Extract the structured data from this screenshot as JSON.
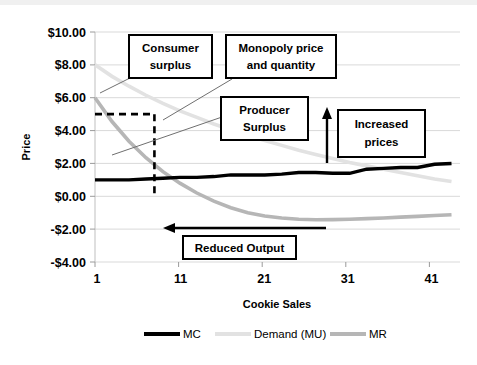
{
  "chart_data": {
    "type": "line",
    "title": "",
    "subtitle": "",
    "xlabel": "Cookie Sales",
    "ylabel": "Price",
    "xlim": [
      1,
      44
    ],
    "ylim": [
      -4,
      10
    ],
    "xticks": [
      "1",
      "11",
      "21",
      "31",
      "41"
    ],
    "xtick_values": [
      1,
      11,
      21,
      31,
      41
    ],
    "yticks": [
      "-$4.00",
      "-$2.00",
      "$0.00",
      "$2.00",
      "$4.00",
      "$6.00",
      "$8.00",
      "$10.00"
    ],
    "ytick_values": [
      -4,
      -2,
      0,
      2,
      4,
      6,
      8,
      10
    ],
    "grid": "horizontal",
    "legend_position": "bottom",
    "x": [
      1,
      3,
      5,
      7,
      9,
      11,
      13,
      15,
      17,
      19,
      21,
      23,
      25,
      27,
      29,
      31,
      33,
      35,
      37,
      39,
      41,
      43
    ],
    "series": [
      {
        "name": "MC",
        "color": "#000000",
        "values": [
          1.0,
          1.0,
          1.0,
          1.05,
          1.1,
          1.15,
          1.15,
          1.2,
          1.3,
          1.3,
          1.3,
          1.35,
          1.45,
          1.45,
          1.4,
          1.4,
          1.65,
          1.7,
          1.75,
          1.75,
          1.95,
          2.0
        ]
      },
      {
        "name": "Demand (MU)",
        "color": "#e2e2e2",
        "values": [
          8.0,
          7.3,
          6.7,
          6.15,
          5.65,
          5.2,
          4.8,
          4.4,
          4.05,
          3.7,
          3.4,
          3.1,
          2.8,
          2.55,
          2.3,
          2.05,
          1.85,
          1.65,
          1.45,
          1.25,
          1.05,
          0.9
        ]
      },
      {
        "name": "MR",
        "color": "#b6b6b6",
        "values": [
          6.0,
          4.55,
          3.35,
          2.35,
          1.5,
          0.8,
          0.2,
          -0.3,
          -0.7,
          -1.0,
          -1.2,
          -1.32,
          -1.4,
          -1.43,
          -1.42,
          -1.4,
          -1.36,
          -1.32,
          -1.27,
          -1.22,
          -1.17,
          -1.12
        ]
      }
    ],
    "reference_lines": [
      {
        "name": "monopoly-price-quantity-dashed",
        "style": "dashed",
        "color": "#000000",
        "price": 5.0,
        "quantity": 8.0,
        "from_y_axis": true,
        "down_to": 0.0
      }
    ],
    "annotations": [
      {
        "name": "consumer-surplus",
        "label_line1": "Consumer",
        "label_line2": "surplus",
        "points_to": "area above demand curve"
      },
      {
        "name": "monopoly-price-and-quantity",
        "label_line1": "Monopoly price",
        "label_line2": "and quantity",
        "points_to": "dashed intersection at $5.00 / Q=8"
      },
      {
        "name": "producer-surplus",
        "label_line1": "Producer",
        "label_line2": "Surplus",
        "points_to": "area between MC and price"
      },
      {
        "name": "increased-prices",
        "label_line1": "Increased",
        "label_line2": "prices",
        "arrow": "up"
      },
      {
        "name": "reduced-output",
        "label_line1": "Reduced  Output",
        "label_line2": "",
        "arrow": "left"
      }
    ],
    "legend": [
      {
        "name": "MC",
        "color": "#000000"
      },
      {
        "name": "Demand (MU)",
        "color": "#e2e2e2"
      },
      {
        "name": "MR",
        "color": "#b6b6b6"
      }
    ]
  }
}
